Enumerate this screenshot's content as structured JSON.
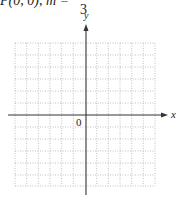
{
  "problem": {
    "header_text": "P(0, 0), m = ",
    "slope_denominator": "3"
  },
  "graph": {
    "x_axis_label": "x",
    "y_axis_label": "y",
    "origin_label": "0",
    "grid_columns": 12,
    "grid_rows": 12,
    "x_range": [
      -6,
      6
    ],
    "y_range": [
      -6,
      6
    ],
    "grid_style": "dotted",
    "axis_color": "#333333",
    "grid_color": "#b0b0b0"
  }
}
